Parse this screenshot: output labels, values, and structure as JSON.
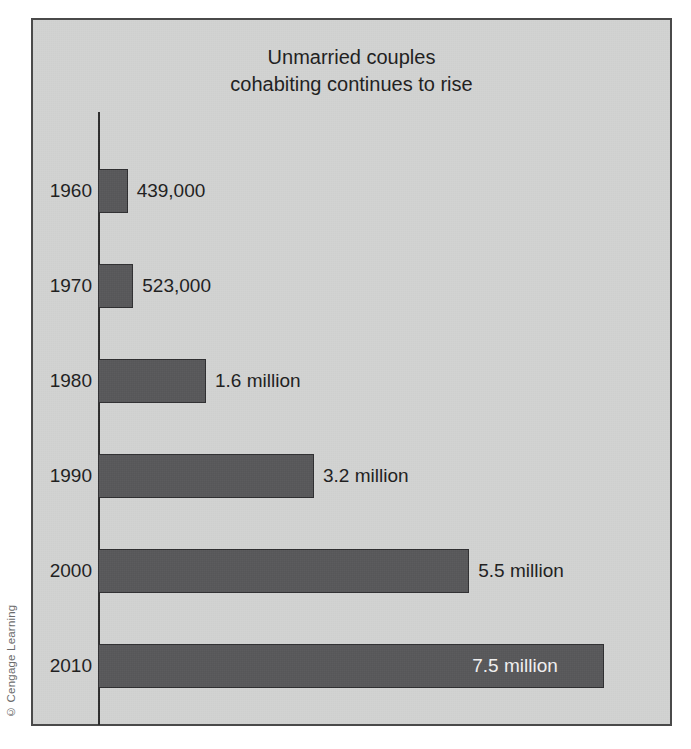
{
  "credit": {
    "text": "© Cengage Learning"
  },
  "chart": {
    "title": "Unmarried couples\ncohabiting continues to rise",
    "colors": {
      "background": "#d2d3d2",
      "bar_fill": "#58585a",
      "bar_border": "#2f2f31",
      "frame_border": "#4a4a4a",
      "text": "#1e1e1e",
      "inside_label_text": "#f2f2f2"
    }
  },
  "chart_data": {
    "type": "bar",
    "orientation": "horizontal",
    "title": "Unmarried couples cohabiting continues to rise",
    "xlabel": "",
    "ylabel": "",
    "grid": false,
    "legend": false,
    "categories": [
      "1960",
      "1970",
      "1980",
      "1990",
      "2000",
      "2010"
    ],
    "values": [
      439000,
      523000,
      1600000,
      3200000,
      5500000,
      7500000
    ],
    "value_labels": [
      "439,000",
      "523,000",
      "1.6 million",
      "3.2 million",
      "5.5 million",
      "7.5 million"
    ],
    "label_placement": [
      "outside",
      "outside",
      "outside",
      "outside",
      "outside",
      "inside"
    ],
    "xlim": [
      0,
      8000000
    ],
    "bars": [
      {
        "category": "1960",
        "value": 439000,
        "label": "439,000",
        "placement": "outside"
      },
      {
        "category": "1970",
        "value": 523000,
        "label": "523,000",
        "placement": "outside"
      },
      {
        "category": "1980",
        "value": 1600000,
        "label": "1.6 million",
        "placement": "outside"
      },
      {
        "category": "1990",
        "value": 3200000,
        "label": "3.2 million",
        "placement": "outside"
      },
      {
        "category": "2000",
        "value": 5500000,
        "label": "5.5 million",
        "placement": "outside"
      },
      {
        "category": "2010",
        "value": 7500000,
        "label": "7.5 million",
        "placement": "inside"
      }
    ]
  }
}
